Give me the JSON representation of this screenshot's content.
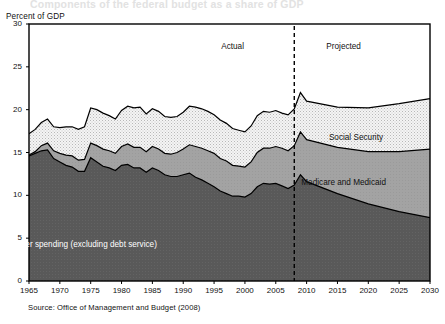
{
  "figure": {
    "ghost_title": "Components of the federal budget as a share of GDP",
    "y_axis_title": "Percent of GDP",
    "source": "Source: Office of Management and Budget (2008)"
  },
  "annotations": {
    "actual": "Actual",
    "projected": "Projected",
    "divider_year": 2008
  },
  "colors": {
    "other_spending": "#595959",
    "medicare_medicaid": "#a3a3a3",
    "social_security": "#ededed",
    "outline": "#000000",
    "background": "#ffffff"
  },
  "chart_data": {
    "type": "area",
    "title": "Components of the federal budget as a share of GDP",
    "subtitle": "",
    "xlabel": "",
    "ylabel": "Percent of GDP",
    "xlim": [
      1965,
      2030
    ],
    "ylim": [
      0,
      30
    ],
    "yticks": [
      0,
      5,
      10,
      15,
      20,
      25,
      30
    ],
    "xticks": [
      1965,
      1970,
      1975,
      1980,
      1985,
      1990,
      1995,
      2000,
      2005,
      2010,
      2015,
      2020,
      2025,
      2030
    ],
    "grid": false,
    "legend_position": "inline-labels",
    "stacked": true,
    "stack_order_bottom_to_top": [
      "Other spending (excluding debt service)",
      "Medicare and Medicaid",
      "Social Security"
    ],
    "x": [
      1965,
      1966,
      1967,
      1968,
      1969,
      1970,
      1971,
      1972,
      1973,
      1974,
      1975,
      1976,
      1977,
      1978,
      1979,
      1980,
      1981,
      1982,
      1983,
      1984,
      1985,
      1986,
      1987,
      1988,
      1989,
      1990,
      1991,
      1992,
      1993,
      1994,
      1995,
      1996,
      1997,
      1998,
      1999,
      2000,
      2001,
      2002,
      2003,
      2004,
      2005,
      2006,
      2007,
      2008,
      2009,
      2010,
      2015,
      2020,
      2025,
      2030
    ],
    "series": [
      {
        "name": "Other spending (excluding debt service)",
        "color": "#595959",
        "values": [
          14.6,
          14.9,
          15.2,
          15.3,
          14.3,
          13.9,
          13.5,
          13.3,
          12.8,
          12.8,
          14.4,
          13.9,
          13.4,
          13.2,
          12.9,
          13.5,
          13.6,
          13.2,
          13.2,
          12.7,
          13.2,
          12.9,
          12.4,
          12.2,
          12.2,
          12.4,
          12.6,
          12.1,
          11.8,
          11.4,
          11.0,
          10.5,
          10.2,
          9.9,
          9.9,
          9.8,
          10.2,
          11.0,
          11.4,
          11.3,
          11.4,
          11.1,
          10.8,
          11.2,
          12.4,
          11.6,
          10.2,
          9.0,
          8.1,
          7.4
        ]
      },
      {
        "name": "Medicare and Medicaid",
        "color": "#a3a3a3",
        "values": [
          0.1,
          0.2,
          0.6,
          0.8,
          0.9,
          1.0,
          1.2,
          1.3,
          1.3,
          1.4,
          1.7,
          1.9,
          2.0,
          2.0,
          2.0,
          2.2,
          2.4,
          2.4,
          2.4,
          2.4,
          2.5,
          2.5,
          2.5,
          2.6,
          2.8,
          3.0,
          3.3,
          3.6,
          3.7,
          3.8,
          3.9,
          3.8,
          3.8,
          3.6,
          3.5,
          3.5,
          3.7,
          4.0,
          4.1,
          4.2,
          4.3,
          4.4,
          4.4,
          4.6,
          5.0,
          4.9,
          5.4,
          6.1,
          7.0,
          8.0
        ]
      },
      {
        "name": "Social Security",
        "color": "#ededed",
        "values": [
          2.5,
          2.6,
          2.7,
          2.8,
          2.8,
          3.0,
          3.3,
          3.4,
          3.6,
          3.8,
          4.1,
          4.2,
          4.2,
          4.1,
          4.0,
          4.2,
          4.4,
          4.6,
          4.7,
          4.4,
          4.4,
          4.4,
          4.3,
          4.3,
          4.2,
          4.3,
          4.5,
          4.6,
          4.6,
          4.6,
          4.5,
          4.5,
          4.4,
          4.3,
          4.2,
          4.1,
          4.2,
          4.3,
          4.3,
          4.2,
          4.2,
          4.1,
          4.2,
          4.3,
          4.6,
          4.5,
          4.7,
          5.1,
          5.6,
          5.9
        ]
      }
    ],
    "annotations": [
      {
        "text": "Actual",
        "x": 1998,
        "y": 27.2
      },
      {
        "text": "Projected",
        "x": 2016,
        "y": 27.2
      },
      {
        "text": "Social Security",
        "x": 2018,
        "y": 16.6
      },
      {
        "text": "Medicare and Medicaid",
        "x": 2016,
        "y": 11.3
      },
      {
        "text": "Other spending (excluding debt service)",
        "x": 1974,
        "y": 4.1
      }
    ]
  }
}
